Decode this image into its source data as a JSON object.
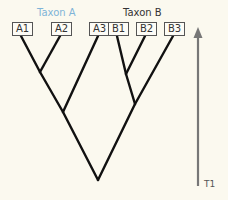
{
  "diagram": {
    "type": "phylogenetic-tree",
    "taxa": [
      {
        "name": "Taxon A",
        "color": "#7fb4d8",
        "x": 37
      },
      {
        "name": "Taxon B",
        "color": "#333333",
        "x": 123
      }
    ],
    "leaves": [
      {
        "label": "A1",
        "x": 12,
        "w": 15
      },
      {
        "label": "A2",
        "x": 51,
        "w": 15
      },
      {
        "label": "A3",
        "x": 89,
        "w": 15
      },
      {
        "label": "B1",
        "x": 108,
        "w": 15
      },
      {
        "label": "B2",
        "x": 136,
        "w": 15
      },
      {
        "label": "B3",
        "x": 164,
        "w": 15
      }
    ],
    "time_axis": {
      "label": "T1",
      "color": "#777777",
      "direction": "up"
    },
    "colors": {
      "branch": "#111111",
      "leaf_border": "#555555",
      "background": "#fbf9ef"
    }
  }
}
